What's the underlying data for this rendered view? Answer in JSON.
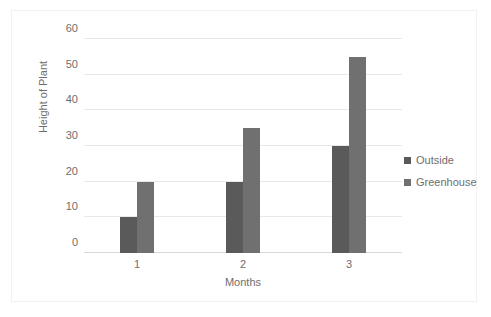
{
  "chart_data": {
    "type": "bar",
    "title": "",
    "xlabel": "Months",
    "ylabel": "Height of Plant",
    "categories": [
      "1",
      "2",
      "3"
    ],
    "series": [
      {
        "name": "Outside",
        "values": [
          10,
          20,
          30
        ],
        "color": "#5a5a5a"
      },
      {
        "name": "Greenhouse",
        "values": [
          20,
          35,
          55
        ],
        "color": "#707070"
      }
    ],
    "ylim": [
      0,
      60
    ],
    "y_ticks": [
      0,
      10,
      20,
      30,
      40,
      50,
      60
    ],
    "y_tick_labels": [
      "0",
      "10",
      "20",
      "30",
      "40",
      "50",
      "60"
    ],
    "grid": true,
    "legend_position": "right"
  },
  "legend": {
    "items": [
      {
        "label": "Outside",
        "color": "#5a5a5a"
      },
      {
        "label": "Greenhouse",
        "color": "#707070"
      }
    ]
  },
  "axes": {
    "y_title": "Height of Plant",
    "x_title": "Months",
    "y_labels": [
      "60",
      "50",
      "40",
      "30",
      "20",
      "10",
      "0"
    ],
    "x_labels": [
      "1",
      "2",
      "3"
    ]
  },
  "colors": {
    "series_outside": "#5a5a5a",
    "series_greenhouse": "#707070",
    "gridline": "#e8e8e8",
    "axis_text": "#6e6e6e",
    "frame_border": "#f2f2f2"
  }
}
